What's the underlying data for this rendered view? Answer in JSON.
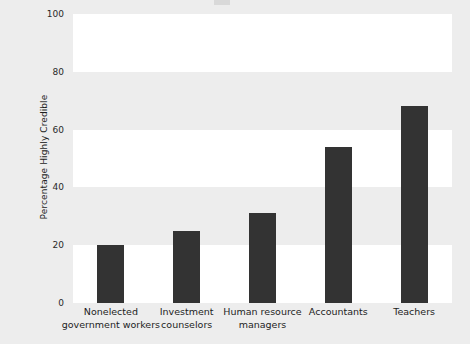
{
  "chart_data": {
    "type": "bar",
    "title": "",
    "xlabel": "",
    "ylabel": "Percentage Highly Credible",
    "categories": [
      "Nonelected government workers",
      "Investment counselors",
      "Human resource managers",
      "Accountants",
      "Teachers"
    ],
    "values": [
      20,
      25,
      31,
      54,
      68
    ],
    "ylim": [
      0,
      100
    ],
    "yticks": [
      0,
      20,
      40,
      60,
      80,
      100
    ],
    "ytick_labels": [
      "0",
      "20",
      "40",
      "60",
      "80",
      "100"
    ],
    "grid": false,
    "banding": true,
    "legend": "none",
    "bar_color": "#333333",
    "plot_background": "#ffffff",
    "band_color": "#ededed",
    "figure_background": "#ededed"
  },
  "axis": {
    "y_title": "Percentage Highly Credible"
  },
  "category_lines": [
    [
      "Nonelected",
      "government workers"
    ],
    [
      "Investment",
      "counselors"
    ],
    [
      "Human resource",
      "managers"
    ],
    [
      "Accountants"
    ],
    [
      "Teachers"
    ]
  ]
}
